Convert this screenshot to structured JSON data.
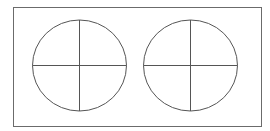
{
  "diagram": {
    "colors": {
      "background": "#ffffff",
      "frame": "#6b6b6b",
      "stroke": "#555555"
    },
    "frame": {
      "x": 13.5,
      "y": 7.5,
      "width": 248,
      "height": 119
    },
    "shapes": [
      {
        "name": "left-circle",
        "cx": 79.5,
        "cy": 65.5,
        "rx": 47,
        "ry": 45.5,
        "divisions": 4
      },
      {
        "name": "right-circle",
        "cx": 190.5,
        "cy": 65.5,
        "rx": 47,
        "ry": 45.5,
        "divisions": 4
      }
    ]
  }
}
